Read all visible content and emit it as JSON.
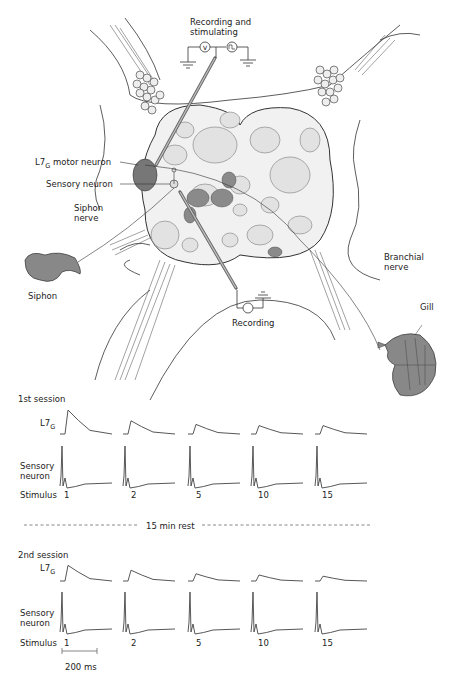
{
  "diagram": {
    "labels": {
      "recording_stimulating": [
        "Recording and",
        "stimulating"
      ],
      "motor_neuron": {
        "main": "L7",
        "sub": "G",
        "rest": " motor neuron"
      },
      "sensory_neuron": "Sensory neuron",
      "siphon_nerve": [
        "Siphon",
        "nerve"
      ],
      "siphon": "Siphon",
      "branchial_nerve": [
        "Branchial",
        "nerve"
      ],
      "recording": "Recording",
      "gill": "Gill",
      "voltmeter_symbol": "V"
    }
  },
  "traces": {
    "session1_title": "1st session",
    "session2_title": "2nd session",
    "motor_label": {
      "main": "L7",
      "sub": "G"
    },
    "sensory_label": [
      "Sensory",
      "neuron"
    ],
    "stimulus_label": "Stimulus",
    "stimulus_numbers": [
      "1",
      "2",
      "5",
      "10",
      "15"
    ],
    "rest_label": "15 min rest",
    "scale_bar": "200 ms"
  },
  "chart_data": {
    "type": "line",
    "sessions": [
      {
        "name": "1st session",
        "stimuli": [
          1,
          2,
          5,
          10,
          15
        ],
        "L7G_epsp_relative_amplitude": [
          1.0,
          0.55,
          0.4,
          0.35,
          0.35
        ],
        "sensory_spike_relative_amplitude": [
          1,
          1,
          1,
          1,
          1
        ]
      },
      {
        "name": "2nd session",
        "stimuli": [
          1,
          2,
          5,
          10,
          15
        ],
        "L7G_epsp_relative_amplitude": [
          0.65,
          0.45,
          0.3,
          0.25,
          0.2
        ],
        "sensory_spike_relative_amplitude": [
          1,
          1,
          1,
          1,
          1
        ]
      }
    ],
    "annotations": [
      "15 min rest",
      "200 ms"
    ],
    "xlabel": "Stimulus"
  }
}
